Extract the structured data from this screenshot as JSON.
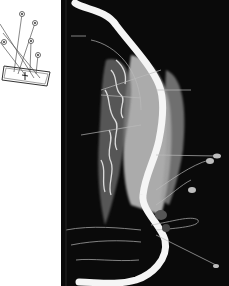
{
  "figure": {
    "type": "anatomical-mri-tractography",
    "inset": {
      "label": "orientation-diagram",
      "markers": 5
    },
    "main": {
      "background": "#0a0a0a",
      "vessel_color": "#f4f4f4",
      "tissue_color": "#bdbdbd"
    }
  }
}
